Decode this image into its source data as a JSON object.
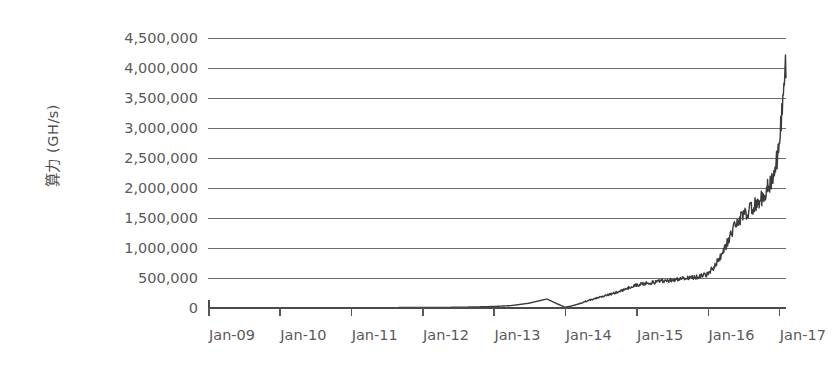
{
  "chart_data": {
    "type": "line",
    "title": "",
    "subtitle": "",
    "xlabel": "",
    "ylabel": "算力 (GH/s)",
    "grid": true,
    "legend": "none",
    "xlim": [
      "Jan-09",
      "Jan-17"
    ],
    "ylim": [
      0,
      4500000
    ],
    "y_ticks": [
      "4,500,000",
      "4,000,000",
      "3,500,000",
      "3,000,000",
      "2,500,000",
      "2,000,000",
      "1,500,000",
      "1,000,000",
      "500,000",
      "0"
    ],
    "y_tick_values": [
      4500000,
      4000000,
      3500000,
      3000000,
      2500000,
      2000000,
      1500000,
      1000000,
      500000,
      0
    ],
    "categories": [
      "Jan-09",
      "Jan-10",
      "Jan-11",
      "Jan-12",
      "Jan-13",
      "Jan-14",
      "Jan-15",
      "Jan-16",
      "Jan-17"
    ],
    "series": [
      {
        "name": "算力",
        "color": "#3b3b3d",
        "x": [
          2009.0,
          2009.25,
          2009.5,
          2009.75,
          2010.0,
          2010.25,
          2010.5,
          2010.75,
          2011.0,
          2011.25,
          2011.5,
          2011.75,
          2012.0,
          2012.25,
          2012.5,
          2012.75,
          2013.0,
          2013.25,
          2013.5,
          2013.75,
          2014.0,
          2014.1,
          2014.2,
          2014.3,
          2014.4,
          2014.5,
          2014.6,
          2014.7,
          2014.8,
          2014.9,
          2015.0,
          2015.1,
          2015.2,
          2015.3,
          2015.4,
          2015.5,
          2015.6,
          2015.7,
          2015.8,
          2015.9,
          2016.0,
          2016.1,
          2016.2,
          2016.3,
          2016.4,
          2016.5,
          2016.6,
          2016.7,
          2016.8,
          2016.9,
          2017.0,
          2017.05,
          2017.1
        ],
        "values": [
          0,
          0,
          0,
          0,
          0,
          0,
          0,
          0,
          500,
          1500,
          5000,
          8000,
          9000,
          10000,
          12000,
          18000,
          25000,
          40000,
          80000,
          150000,
          12000,
          35000,
          70000,
          110000,
          150000,
          185000,
          215000,
          250000,
          290000,
          340000,
          380000,
          400000,
          420000,
          440000,
          455000,
          470000,
          480000,
          495000,
          510000,
          530000,
          560000,
          700000,
          900000,
          1150000,
          1400000,
          1550000,
          1650000,
          1750000,
          1900000,
          2150000,
          2600000,
          3400000,
          4130000
        ],
        "final_value": 4130000,
        "peak_value": 4170000,
        "noise": "high"
      }
    ]
  },
  "axes": {
    "y_title": "算力 (GH/s)",
    "x_title": ""
  },
  "style": {
    "background": "#ffffff",
    "grid_color": "#6e6e70",
    "axis_color": "#4a4a4c",
    "text_color": "#5a5a5c",
    "series_color": "#3b3b3d"
  }
}
